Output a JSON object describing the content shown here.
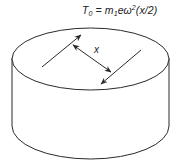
{
  "formula": {
    "lhs": "T",
    "lhs_sub": "0",
    "equals": " = m",
    "m_sub": "1",
    "mid": "eω",
    "omega_sup": "2",
    "rest": "(x/2)"
  },
  "dimension_label": "x",
  "colors": {
    "stroke": "#2a2a2a",
    "background": "#ffffff"
  }
}
